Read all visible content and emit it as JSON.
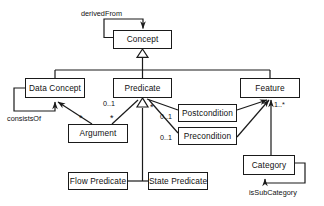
{
  "diagram": {
    "type": "uml-class-diagram",
    "title": "",
    "classes": [
      {
        "id": "concept",
        "label": "Concept",
        "x": 113,
        "y": 30,
        "w": 59,
        "h": 19
      },
      {
        "id": "data-concept",
        "label": "Data Concept",
        "x": 25,
        "y": 78,
        "w": 60,
        "h": 20
      },
      {
        "id": "predicate",
        "label": "Predicate",
        "x": 113,
        "y": 78,
        "w": 59,
        "h": 20
      },
      {
        "id": "feature",
        "label": "Feature",
        "x": 240,
        "y": 78,
        "w": 60,
        "h": 20
      },
      {
        "id": "postcondition",
        "label": "Postcondition",
        "x": 178,
        "y": 104,
        "w": 59,
        "h": 18
      },
      {
        "id": "argument",
        "label": "Argument",
        "x": 68,
        "y": 124,
        "w": 60,
        "h": 19
      },
      {
        "id": "precondition",
        "label": "Precondition",
        "x": 178,
        "y": 127,
        "w": 59,
        "h": 18
      },
      {
        "id": "category",
        "label": "Category",
        "x": 243,
        "y": 155,
        "w": 52,
        "h": 20
      },
      {
        "id": "flow-predicate",
        "label": "Flow Predicate",
        "x": 68,
        "y": 172,
        "w": 60,
        "h": 18
      },
      {
        "id": "state-predicate",
        "label": "State Predicate",
        "x": 148,
        "y": 172,
        "w": 60,
        "h": 18
      }
    ],
    "association_labels": [
      {
        "id": "derived-from",
        "text": "derivedFrom",
        "x": 81,
        "y": 10
      },
      {
        "id": "consists-of",
        "text": "consistsOf",
        "x": 7,
        "y": 115
      },
      {
        "id": "is-sub-category",
        "text": "isSubCategory",
        "x": 249,
        "y": 189
      }
    ],
    "multiplicities": [
      {
        "id": "mult-predicate-argument",
        "text": "0..1",
        "x": 103,
        "y": 100
      },
      {
        "id": "mult-postcondition-predicate",
        "text": "0..1",
        "x": 160,
        "y": 113
      },
      {
        "id": "mult-precondition-predicate",
        "text": "0..1",
        "x": 160,
        "y": 134
      },
      {
        "id": "mult-feature-category",
        "text": "1..*",
        "x": 274,
        "y": 101
      },
      {
        "id": "mult-argument-data-concept",
        "text": "*",
        "x": 79,
        "y": 116
      },
      {
        "id": "mult-argument-predicate",
        "text": "*",
        "x": 110,
        "y": 116
      },
      {
        "id": "mult-predicate-postcondition",
        "text": "*",
        "x": 150,
        "y": 105
      }
    ],
    "generalizations": [
      {
        "id": "gen-concept",
        "parent": "concept",
        "children": [
          "data-concept",
          "predicate",
          "feature"
        ]
      },
      {
        "id": "gen-predicate",
        "parent": "predicate",
        "children": [
          "flow-predicate",
          "state-predicate"
        ]
      }
    ],
    "associations": [
      {
        "id": "assoc-derived-from",
        "from": "concept",
        "to": "concept",
        "label": "derivedFrom"
      },
      {
        "id": "assoc-consists-of",
        "from": "data-concept",
        "to": "data-concept",
        "label": "consistsOf"
      },
      {
        "id": "assoc-is-sub-category",
        "from": "category",
        "to": "category",
        "label": "isSubCategory"
      },
      {
        "id": "assoc-arg-data",
        "from": "argument",
        "to": "data-concept",
        "label": ""
      },
      {
        "id": "assoc-arg-pred",
        "from": "argument",
        "to": "predicate",
        "label": ""
      },
      {
        "id": "assoc-post-pred",
        "from": "postcondition",
        "to": "predicate",
        "label": ""
      },
      {
        "id": "assoc-pre-pred",
        "from": "precondition",
        "to": "predicate",
        "label": ""
      },
      {
        "id": "assoc-post-feature",
        "from": "postcondition",
        "to": "feature",
        "label": ""
      },
      {
        "id": "assoc-pre-feature",
        "from": "precondition",
        "to": "feature",
        "label": ""
      },
      {
        "id": "assoc-cat-feature",
        "from": "category",
        "to": "feature",
        "label": ""
      }
    ],
    "style": {
      "line_color": "#1a1a1a",
      "box_fill": "#ffffff",
      "text_color": "#111111",
      "background": "#ffffff"
    }
  }
}
